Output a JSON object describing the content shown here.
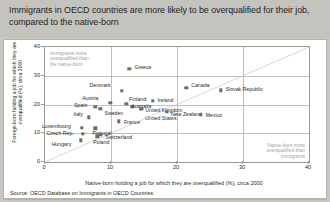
{
  "header": {
    "title": "Immigrants in OECD countries are more likely to be overqualified for their job, compared to the native-born"
  },
  "source": "Source: OECD Database on Immigrants in OECD Countries",
  "annotations": {
    "top_left": "Immigrants more\noverqualified than\nthe native-born",
    "bottom_right": "Native-born more\noverqualified than\nimmigrants"
  },
  "chart_data": {
    "type": "scatter",
    "title": "",
    "xlabel": "Native-born holding a job for which they are overqualified (%), circa 2000",
    "ylabel": "Foreign-born holding a job for which they are overqualified (%), circa 2000",
    "xlim": [
      0,
      40
    ],
    "ylim": [
      0,
      40
    ],
    "xticks": [
      0,
      10,
      20,
      30,
      40
    ],
    "yticks": [
      0,
      10,
      20,
      30,
      40
    ],
    "grid": true,
    "legend": "none",
    "reference_line": {
      "type": "identity",
      "label": "y = x"
    },
    "points": [
      {
        "label": "Greece",
        "x": 12.8,
        "y": 32.4,
        "lx": 5,
        "ly": -2
      },
      {
        "label": "Denmark",
        "x": 11.6,
        "y": 24.7,
        "lx": -32,
        "ly": -6
      },
      {
        "label": "Canada",
        "x": 21.4,
        "y": 25.9,
        "lx": 5,
        "ly": -3
      },
      {
        "label": "Slovak Republic",
        "x": 26.6,
        "y": 24.9,
        "lx": 5,
        "ly": -1
      },
      {
        "label": "Austria",
        "x": 9.9,
        "y": 20.5,
        "lx": -28,
        "ly": -5
      },
      {
        "label": "Finland",
        "x": 13.2,
        "y": 19.2,
        "lx": -3,
        "ly": -8
      },
      {
        "label": "Australia",
        "x": 12.3,
        "y": 20.3,
        "lx": 5,
        "ly": 2
      },
      {
        "label": "Ireland",
        "x": 16.3,
        "y": 21.2,
        "lx": 5,
        "ly": -1
      },
      {
        "label": "Spain",
        "x": 7.6,
        "y": 19.3,
        "lx": -21,
        "ly": -2
      },
      {
        "label": "Sweden",
        "x": 8.4,
        "y": 18.6,
        "lx": 4,
        "ly": 4
      },
      {
        "label": "United Kingdom",
        "x": 14.6,
        "y": 18.5,
        "lx": 4,
        "ly": 1
      },
      {
        "label": "New Zealand",
        "x": 18.5,
        "y": 17.5,
        "lx": 4,
        "ly": 2
      },
      {
        "label": "Mexico",
        "x": 23.6,
        "y": 16.4,
        "lx": 5,
        "ly": 0
      },
      {
        "label": "Italy",
        "x": 6.6,
        "y": 15.5,
        "lx": -15,
        "ly": -3
      },
      {
        "label": "France",
        "x": 11.2,
        "y": 14.1,
        "lx": 5,
        "ly": 1
      },
      {
        "label": "United States",
        "x": 14.6,
        "y": 18.5,
        "lx": 4,
        "ly": 9
      },
      {
        "label": "Luxembourg",
        "x": 5.6,
        "y": 12.0,
        "lx": -40,
        "ly": -2
      },
      {
        "label": "Portugal",
        "x": 7.6,
        "y": 11.7,
        "lx": -3,
        "ly": 5
      },
      {
        "label": "Czech Rep.",
        "x": 5.7,
        "y": 9.8,
        "lx": -36,
        "ly": -1
      },
      {
        "label": "Switzerland",
        "x": 8.4,
        "y": 9.5,
        "lx": 5,
        "ly": 2
      },
      {
        "label": "Poland",
        "x": 7.9,
        "y": 9.0,
        "lx": -4,
        "ly": 6
      },
      {
        "label": "Hungary",
        "x": 5.4,
        "y": 7.6,
        "lx": -29,
        "ly": 4
      }
    ]
  }
}
